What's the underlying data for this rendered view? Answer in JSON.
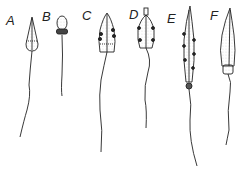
{
  "figure": {
    "ink_color": "#222222",
    "background": "#ffffff",
    "cells": [
      {
        "label": "A",
        "x": 12,
        "y": 20
      },
      {
        "label": "B",
        "x": 44,
        "y": 15
      },
      {
        "label": "C",
        "x": 83,
        "y": 13
      },
      {
        "label": "D",
        "x": 128,
        "y": 11
      },
      {
        "label": "E",
        "x": 167,
        "y": 15
      },
      {
        "label": "F",
        "x": 210,
        "y": 11
      }
    ]
  }
}
